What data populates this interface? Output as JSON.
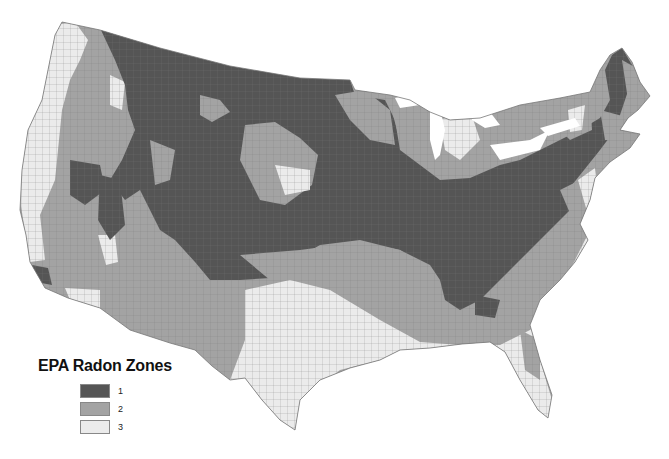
{
  "map": {
    "title": "EPA Radon Zones",
    "region": "Contiguous United States (county level)",
    "colors": {
      "zone1": "#555555",
      "zone2": "#a3a3a3",
      "zone3": "#ebebeb",
      "border": "#8a8a8a",
      "background": "#ffffff"
    }
  },
  "legend": {
    "title": "EPA Radon Zones",
    "items": [
      {
        "label": "1",
        "color": "#555555"
      },
      {
        "label": "2",
        "color": "#a3a3a3"
      },
      {
        "label": "3",
        "color": "#ebebeb"
      }
    ]
  }
}
